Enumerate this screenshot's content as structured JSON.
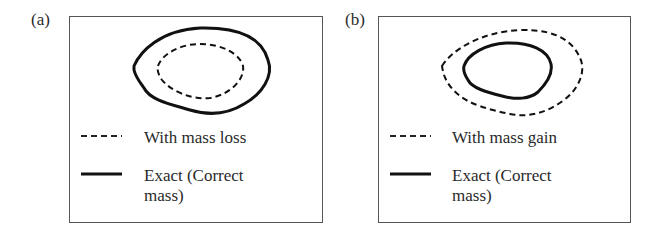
{
  "panels": [
    {
      "label": "(a)",
      "legend": [
        {
          "style": "dashed",
          "text": "With mass loss"
        },
        {
          "style": "solid",
          "text_line1": "Exact (Correct",
          "text_line2": "mass)"
        }
      ],
      "description": "Solid outer contour (exact) enclosing dashed inner contour (mass loss)"
    },
    {
      "label": "(b)",
      "legend": [
        {
          "style": "dashed",
          "text": "With mass gain"
        },
        {
          "style": "solid",
          "text_line1": "Exact (Correct",
          "text_line2": "mass)"
        }
      ],
      "description": "Dashed outer contour (mass gain) enclosing solid inner contour (exact)"
    }
  ]
}
